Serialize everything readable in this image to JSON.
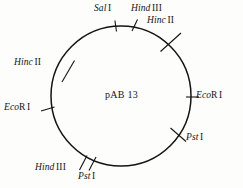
{
  "figure": {
    "background_color": "#fdfdfb",
    "line_color": "#141414",
    "plasmid_name": "pAB 13",
    "shape": "circle",
    "circle": {
      "cx": 121,
      "cy": 96,
      "r": 70
    }
  },
  "sites": [
    {
      "id": "sal-i-top",
      "enzyme": "Sal",
      "numeral": "I",
      "suffix": "",
      "position": "top-left-of-apex",
      "angle_deg": 95
    },
    {
      "id": "hind-iii-top",
      "enzyme": "Hind",
      "numeral": "III",
      "suffix": "",
      "position": "top-right-of-apex",
      "angle_deg": 78
    },
    {
      "id": "hinc-ii-upper-right",
      "enzyme": "Hinc",
      "numeral": "II",
      "suffix": "",
      "position": "upper-right",
      "angle_deg": 57
    },
    {
      "id": "hinc-ii-left",
      "enzyme": "Hinc",
      "numeral": "II",
      "suffix": "",
      "position": "upper-left",
      "angle_deg": 146
    },
    {
      "id": "ecor-i-left",
      "enzyme": "Eco",
      "numeral": "I",
      "suffix": "R",
      "position": "left",
      "angle_deg": 186
    },
    {
      "id": "ecor-i-right",
      "enzyme": "Eco",
      "numeral": "I",
      "suffix": "R",
      "position": "right",
      "angle_deg": 2
    },
    {
      "id": "pst-i-right",
      "enzyme": "Pst",
      "numeral": "I",
      "suffix": "",
      "position": "lower-right",
      "angle_deg": -37
    },
    {
      "id": "hind-iii-bottom",
      "enzyme": "Hind",
      "numeral": "III",
      "suffix": "",
      "position": "lower-left",
      "angle_deg": -118
    },
    {
      "id": "pst-i-bottom",
      "enzyme": "Pst",
      "numeral": "I",
      "suffix": "",
      "position": "bottom-left",
      "angle_deg": -106
    }
  ]
}
